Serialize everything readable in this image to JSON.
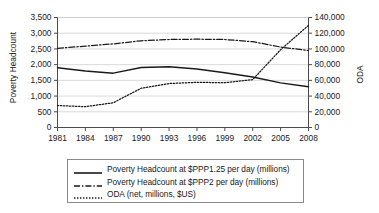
{
  "chart_data": {
    "type": "line",
    "title": "",
    "xlabel": "",
    "ylabel": "Poverty Headcount",
    "ylabel_secondary": "ODA",
    "x": [
      1981,
      1984,
      1987,
      1990,
      1993,
      1996,
      1999,
      2002,
      2005,
      2008
    ],
    "xtick_labels": [
      "1981",
      "1984",
      "1987",
      "1990",
      "1993",
      "1996",
      "1999",
      "2002",
      "2005",
      "2008"
    ],
    "xlim": [
      1981,
      2008
    ],
    "ylim": [
      0,
      3500
    ],
    "ytick_labels": [
      "0",
      "500",
      "1,000",
      "1,500",
      "2,000",
      "2,500",
      "3,000",
      "3,500"
    ],
    "ytick_values": [
      0,
      500,
      1000,
      1500,
      2000,
      2500,
      3000,
      3500
    ],
    "ylim_secondary": [
      0,
      140000
    ],
    "ytick_labels_secondary": [
      "0",
      "20,000",
      "40,000",
      "60,000",
      "80,000",
      "100,000",
      "120,000",
      "140,000"
    ],
    "ytick_values_secondary": [
      0,
      20000,
      40000,
      60000,
      80000,
      100000,
      120000,
      140000
    ],
    "grid": true,
    "legend_position": "below",
    "series": [
      {
        "name": "Poverty Headcount at $PPP1.25 per day (millions)",
        "axis": "left",
        "style": "solid",
        "color": "#1a1a1a",
        "values": [
          1900,
          1800,
          1730,
          1910,
          1930,
          1860,
          1740,
          1610,
          1420,
          1300
        ]
      },
      {
        "name": "Poverty Headcount at $PPP2 per day (millions)",
        "axis": "left",
        "style": "dashdot",
        "color": "#1a1a1a",
        "values": [
          2520,
          2590,
          2660,
          2760,
          2800,
          2810,
          2800,
          2730,
          2560,
          2450
        ]
      },
      {
        "name": "ODA (net, millions, $US)",
        "axis": "right",
        "style": "dotted",
        "color": "#1a1a1a",
        "values": [
          28000,
          26500,
          31500,
          50000,
          56000,
          57500,
          57000,
          61000,
          99000,
          130000
        ]
      }
    ]
  },
  "legend": {
    "items": [
      {
        "label": "Poverty Headcount at $PPP1.25 per day (millions)",
        "style": "solid"
      },
      {
        "label": "Poverty Headcount at $PPP2 per day (millions)",
        "style": "dashdot"
      },
      {
        "label": "ODA (net, millions, $US)",
        "style": "dotted"
      }
    ]
  },
  "caption": {
    "text": ""
  }
}
